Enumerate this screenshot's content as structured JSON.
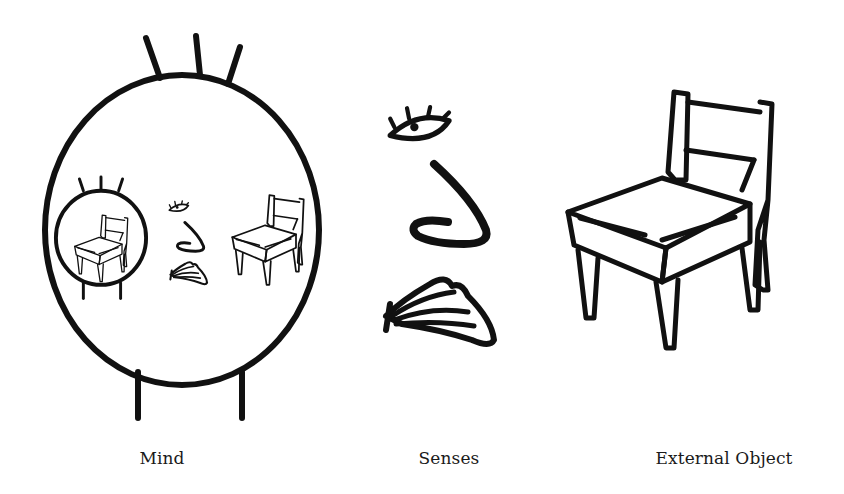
{
  "diagram": {
    "type": "conceptual-illustration",
    "ink_color": "#111111",
    "background_color": "#ffffff",
    "panels": [
      {
        "id": "mind",
        "label": "Mind",
        "contents": [
          "head-outline",
          "inner-mind-with-chair",
          "eye",
          "nose",
          "tongue",
          "chair"
        ]
      },
      {
        "id": "senses",
        "label": "Senses",
        "contents": [
          "eye",
          "nose",
          "tongue"
        ]
      },
      {
        "id": "external-object",
        "label": "External Object",
        "contents": [
          "chair"
        ]
      }
    ]
  },
  "labels": {
    "mind": "Mind",
    "senses": "Senses",
    "external_object": "External Object"
  }
}
